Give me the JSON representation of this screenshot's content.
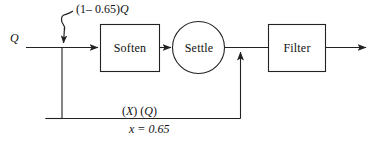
{
  "diagram": {
    "type": "block-flow-diagram-with-feedback",
    "blocks": [
      {
        "id": "soften",
        "label": "Soften",
        "shape": "rectangle"
      },
      {
        "id": "settle",
        "label": "Settle",
        "shape": "circle"
      },
      {
        "id": "filter",
        "label": "Filter",
        "shape": "rectangle"
      }
    ],
    "labels": {
      "input": "Q",
      "top_expression": "(1– 0.65)Q",
      "top_expression_prefix": "(1– 0.65)",
      "top_expression_var": "Q",
      "feedback_product": "(X) (Q)",
      "feedback_product_x": "X",
      "feedback_product_q": "Q",
      "x_value": "x = 0.65"
    },
    "colors": {
      "stroke": "#222222",
      "text": "#111111",
      "background": "#ffffff"
    }
  }
}
